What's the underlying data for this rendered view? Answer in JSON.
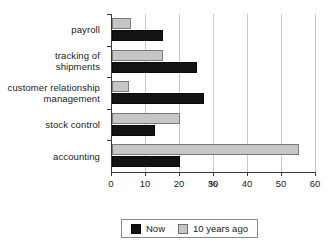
{
  "chart_data": {
    "type": "bar",
    "orientation": "horizontal",
    "title": "",
    "xlabel": "%",
    "ylabel": "",
    "xlim": [
      0,
      60
    ],
    "xticks": [
      0,
      10,
      20,
      30,
      40,
      50,
      60
    ],
    "xtick_labels": [
      "0",
      "10",
      "20",
      "30",
      "40",
      "50",
      "60"
    ],
    "grid": true,
    "grid_axis": "x",
    "legend_position": "bottom",
    "categories": [
      "payroll",
      "tracking of shipments",
      "customer relationship management",
      "stock control",
      "accounting"
    ],
    "category_label_lines": [
      [
        "payroll"
      ],
      [
        "tracking of",
        "shipments"
      ],
      [
        "customer relationship",
        "management"
      ],
      [
        "stock control"
      ],
      [
        "accounting"
      ]
    ],
    "series": [
      {
        "name": "Now",
        "color": "#131313",
        "values": [
          15,
          25,
          27,
          12.5,
          20
        ]
      },
      {
        "name": "10 years ago",
        "color": "#c6c6c6",
        "values": [
          5.5,
          15,
          5,
          20,
          55
        ]
      }
    ]
  },
  "axis": {
    "x_title": "%"
  },
  "legend": {
    "entries": [
      {
        "label": "Now",
        "swatch": "now"
      },
      {
        "label": "10 years ago",
        "swatch": "ago"
      }
    ]
  }
}
